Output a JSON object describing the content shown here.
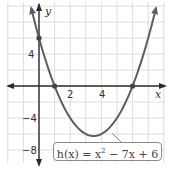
{
  "chart_data": {
    "type": "line",
    "title": "",
    "function_label": "h(x) = x² − 7x + 6",
    "function": {
      "name": "h",
      "a": 1,
      "b": -7,
      "c": 6
    },
    "xlabel": "x",
    "ylabel": "y",
    "xlim": [
      -2,
      8
    ],
    "ylim": [
      -10,
      10
    ],
    "x_ticks": [
      2,
      4
    ],
    "y_ticks": [
      4,
      -4,
      -8
    ],
    "grid": true,
    "grid_x_step": 1,
    "grid_y_step": 2,
    "marked_points": [
      {
        "x": 0,
        "y": 6
      },
      {
        "x": 1,
        "y": 0
      },
      {
        "x": 6,
        "y": 0
      }
    ],
    "vertex": {
      "x": 3.5,
      "y": -6.25
    },
    "series": [
      {
        "name": "h(x) = x^2 - 7x + 6",
        "color": "#5e5e5e"
      }
    ]
  },
  "labels": {
    "x_axis": "x",
    "y_axis": "y",
    "tick_2": "2",
    "tick_4": "4",
    "ytick_4": "4",
    "ytick_neg4": "−4",
    "ytick_neg8": "−8",
    "formula_prefix": "h(x) = x",
    "formula_exp": "2",
    "formula_suffix": " − 7x + 6"
  },
  "colors": {
    "grid": "#d4d4d4",
    "axis": "#2b2b2b",
    "curve": "#5e5e5e"
  }
}
